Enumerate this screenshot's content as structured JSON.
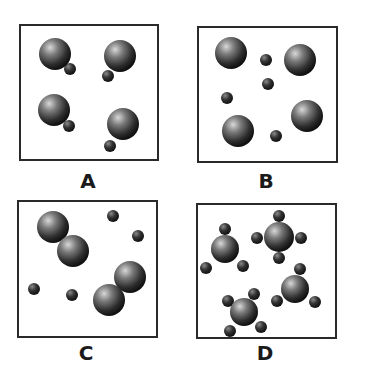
{
  "figure": {
    "panels": [
      {
        "id": "A",
        "label": "A",
        "description": "Four diatomic molecules, each a large atom bonded to a small atom",
        "box": {
          "x": 19,
          "y": 24,
          "w": 140,
          "h": 137
        },
        "atoms": [
          {
            "cx": 34,
            "cy": 28,
            "r": 16,
            "size": "large"
          },
          {
            "cx": 49,
            "cy": 43,
            "r": 6,
            "size": "small"
          },
          {
            "cx": 99,
            "cy": 30,
            "r": 16,
            "size": "large"
          },
          {
            "cx": 87,
            "cy": 50,
            "r": 6,
            "size": "small"
          },
          {
            "cx": 33,
            "cy": 84,
            "r": 16,
            "size": "large"
          },
          {
            "cx": 48,
            "cy": 100,
            "r": 6,
            "size": "small"
          },
          {
            "cx": 102,
            "cy": 98,
            "r": 16,
            "size": "large"
          },
          {
            "cx": 89,
            "cy": 120,
            "r": 6,
            "size": "small"
          }
        ],
        "label_pos": {
          "x": 68,
          "y": 171
        }
      },
      {
        "id": "B",
        "label": "B",
        "description": "Four separate large atoms and four separate small atoms",
        "box": {
          "x": 197,
          "y": 26,
          "w": 141,
          "h": 137
        },
        "atoms": [
          {
            "cx": 32,
            "cy": 25,
            "r": 16,
            "size": "large"
          },
          {
            "cx": 101,
            "cy": 32,
            "r": 16,
            "size": "large"
          },
          {
            "cx": 108,
            "cy": 88,
            "r": 16,
            "size": "large"
          },
          {
            "cx": 39,
            "cy": 103,
            "r": 16,
            "size": "large"
          },
          {
            "cx": 67,
            "cy": 32,
            "r": 6,
            "size": "small"
          },
          {
            "cx": 69,
            "cy": 56,
            "r": 6,
            "size": "small"
          },
          {
            "cx": 28,
            "cy": 70,
            "r": 6,
            "size": "small"
          },
          {
            "cx": 77,
            "cy": 108,
            "r": 6,
            "size": "small"
          }
        ],
        "label_pos": {
          "x": 246,
          "y": 171
        }
      },
      {
        "id": "C",
        "label": "C",
        "description": "Two diatomic molecules of large atoms and four separate small atoms",
        "box": {
          "x": 17,
          "y": 200,
          "w": 141,
          "h": 138
        },
        "atoms": [
          {
            "cx": 34,
            "cy": 25,
            "r": 16,
            "size": "large"
          },
          {
            "cx": 54,
            "cy": 49,
            "r": 16,
            "size": "large"
          },
          {
            "cx": 111,
            "cy": 75,
            "r": 16,
            "size": "large"
          },
          {
            "cx": 90,
            "cy": 98,
            "r": 16,
            "size": "large"
          },
          {
            "cx": 94,
            "cy": 14,
            "r": 6,
            "size": "small"
          },
          {
            "cx": 119,
            "cy": 34,
            "r": 6,
            "size": "small"
          },
          {
            "cx": 15,
            "cy": 87,
            "r": 6,
            "size": "small"
          },
          {
            "cx": 53,
            "cy": 93,
            "r": 6,
            "size": "small"
          }
        ],
        "label_pos": {
          "x": 66,
          "y": 343
        }
      },
      {
        "id": "D",
        "label": "D",
        "description": "Four molecules, each a central atom bonded to four small atoms (tetrahedral)",
        "box": {
          "x": 196,
          "y": 203,
          "w": 141,
          "h": 136
        },
        "molecules": [
          {
            "cx": 27,
            "cy": 44,
            "r": 14,
            "subs": [
              [
                0,
                -20
              ],
              [
                -19,
                19
              ],
              [
                18,
                17
              ]
            ],
            "extra": [
              [
                -4,
                30
              ]
            ]
          },
          {
            "cx": 81,
            "cy": 32,
            "r": 15,
            "subs": [
              [
                0,
                -21
              ],
              [
                -22,
                1
              ],
              [
                22,
                1
              ],
              [
                0,
                21
              ]
            ]
          },
          {
            "cx": 97,
            "cy": 84,
            "r": 14,
            "subs": [
              [
                5,
                -20
              ],
              [
                -18,
                12
              ],
              [
                20,
                13
              ]
            ]
          },
          {
            "cx": 46,
            "cy": 107,
            "r": 14,
            "subs": [
              [
                -16,
                -11
              ],
              [
                10,
                -18
              ],
              [
                17,
                15
              ],
              [
                -14,
                19
              ]
            ]
          }
        ],
        "label_pos": {
          "x": 245,
          "y": 343
        }
      }
    ]
  },
  "colors": {
    "border": "#2a2a2a",
    "atom_light": "#c8c8c8",
    "atom_mid": "#6a6a6a",
    "atom_dark": "#1e1e1e",
    "label": "#1a1a1a"
  }
}
